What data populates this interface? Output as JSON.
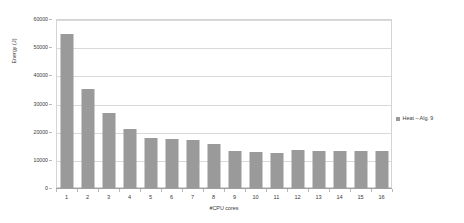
{
  "chart_data": {
    "type": "bar",
    "title": "",
    "xlabel": "#CPU cores",
    "ylabel": "Energy (J)",
    "categories": [
      "1",
      "2",
      "3",
      "4",
      "5",
      "6",
      "7",
      "8",
      "9",
      "10",
      "11",
      "12",
      "13",
      "14",
      "15",
      "16"
    ],
    "values": [
      54600,
      35000,
      26500,
      21000,
      17700,
      17400,
      17000,
      15500,
      13300,
      12900,
      12400,
      13500,
      13300,
      13200,
      13100,
      13000
    ],
    "series": [
      {
        "name": "Heat – Alg. 9",
        "color": "#9a9a9a",
        "values": [
          54600,
          35000,
          26500,
          21000,
          17700,
          17400,
          17000,
          15500,
          13300,
          12900,
          12400,
          13500,
          13300,
          13200,
          13100,
          13000
        ]
      }
    ],
    "ylim": [
      0,
      60000
    ],
    "y_ticks": [
      0,
      10000,
      20000,
      30000,
      40000,
      50000,
      60000
    ],
    "y_tick_labels": [
      "0",
      "10000",
      "20000",
      "30000",
      "40000",
      "50000",
      "60000"
    ],
    "grid": true,
    "legend_position": "right",
    "legend_entries": [
      "Heat – Alg. 9"
    ]
  },
  "axes": {
    "y_title": "Energy (J)",
    "x_title": "#CPU cores"
  },
  "legend": {
    "entry_label": "Heat – Alg. 9"
  },
  "colors": {
    "bar": "#9a9a9a",
    "grid": "#d9d9d9",
    "frame": "#d4d4d4",
    "text": "#3a3a3a",
    "background": "#ffffff"
  }
}
